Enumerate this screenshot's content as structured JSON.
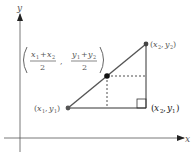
{
  "diagram": {
    "axes": {
      "x_label": "x",
      "y_label": "y",
      "color": "#444444"
    },
    "points": [
      {
        "id": "p1",
        "label": "(x₁, y₁)",
        "x_sub": "1",
        "y_sub": "1",
        "px": 68,
        "py": 108
      },
      {
        "id": "p2",
        "label": "(x₂, y₂)",
        "x_sub": "2",
        "y_sub": "2",
        "px": 146,
        "py": 44
      },
      {
        "id": "mid",
        "label": "((x₁ + x₂)/2, (y₁ + y₂)/2)",
        "px": 107,
        "py": 76
      }
    ],
    "corner": {
      "label": "(x₂, y₁)",
      "px": 146,
      "py": 108
    },
    "midpoint_formula": {
      "x_numerator_a": "x",
      "x_numerator_a_sub": "1",
      "x_numerator_b": "x",
      "x_numerator_b_sub": "2",
      "y_numerator_a": "y",
      "y_numerator_a_sub": "1",
      "y_numerator_b": "y",
      "y_numerator_b_sub": "2",
      "plus": "+",
      "denominator": "2",
      "comma": ","
    },
    "labels": {
      "p1_x": "x",
      "p1_xsub": "1",
      "p1_y": "y",
      "p1_ysub": "1",
      "p2_x": "x",
      "p2_xsub": "2",
      "p2_y": "y",
      "p2_ysub": "2",
      "c_x": "x",
      "c_xsub": "2",
      "c_y": "y",
      "c_ysub": "1",
      "open_paren": "(",
      "close_paren": ")",
      "sep": ","
    },
    "colors": {
      "segment": "#555555",
      "dashed": "#222222",
      "point": "#444444",
      "axis": "#444444"
    }
  }
}
